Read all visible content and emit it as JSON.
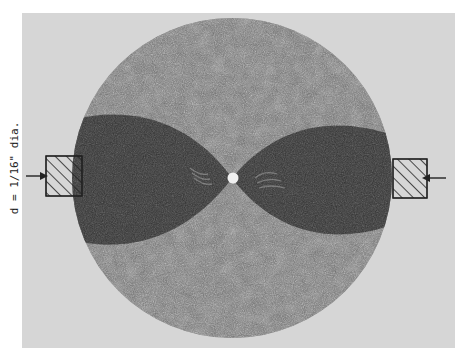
{
  "figure": {
    "caption": "d = 1/16\" dia.",
    "elements": {
      "disc": "circular specimen disc",
      "hole": "central hole",
      "lobes": [
        "left dark lobe",
        "right dark lobe"
      ],
      "clamps": [
        "left loading block",
        "right loading block"
      ],
      "arrows": [
        "left load arrow pointing right",
        "right load arrow pointing left"
      ]
    },
    "colors": {
      "background": "#ffffff",
      "frame": "#d6d6d6",
      "disc_field": "#5a5a5a",
      "lobe": "#2a2a2a",
      "hole": "#f2f2f2",
      "line": "#222222"
    }
  }
}
